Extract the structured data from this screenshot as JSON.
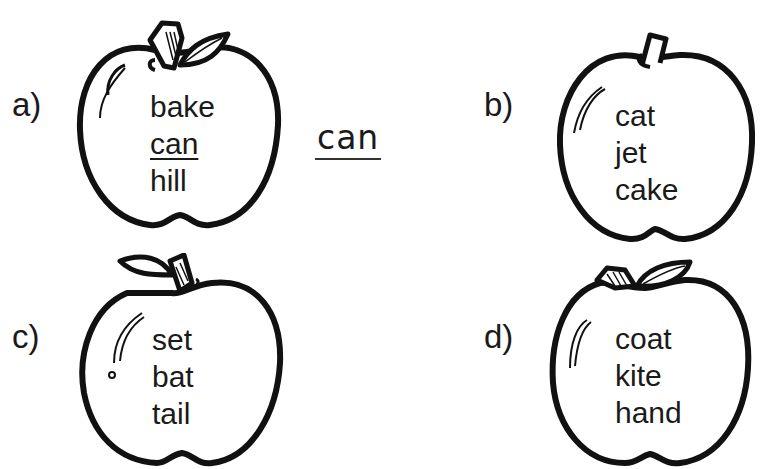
{
  "questions": [
    {
      "label": "a)",
      "words": [
        "bake",
        "can",
        "hill"
      ],
      "underlined_index": 1
    },
    {
      "label": "b)",
      "words": [
        "cat",
        "jet",
        "cake"
      ]
    },
    {
      "label": "c)",
      "words": [
        "set",
        "bat",
        "tail"
      ]
    },
    {
      "label": "d)",
      "words": [
        "coat",
        "kite",
        "hand"
      ]
    }
  ],
  "answer_a": "can",
  "colors": {
    "ink": "#1a1a1a",
    "background": "#ffffff"
  }
}
